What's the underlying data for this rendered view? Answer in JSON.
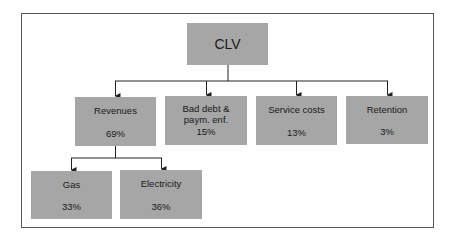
{
  "diagram": {
    "root": {
      "label": "CLV"
    },
    "level1": [
      {
        "label": "Revenues",
        "value": "69%"
      },
      {
        "label": "Bad debt & paym. enf.",
        "label_line1": "Bad debt &",
        "label_line2": "paym. enf.",
        "value": "15%"
      },
      {
        "label": "Service costs",
        "value": "13%"
      },
      {
        "label": "Retention",
        "value": "3%"
      }
    ],
    "revenues_children": [
      {
        "label": "Gas",
        "value": "33%"
      },
      {
        "label": "Electricity",
        "value": "36%"
      }
    ],
    "colors": {
      "node_fill": "#a6a6a6",
      "line": "#222222",
      "frame": "#555555"
    }
  }
}
